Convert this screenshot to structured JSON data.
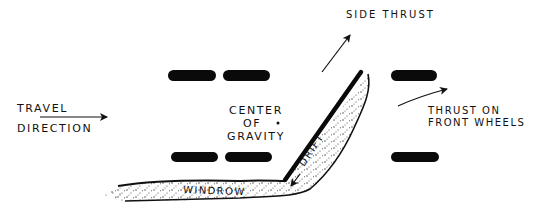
{
  "diagram": {
    "labels": {
      "travel_line1": "TRAVEL",
      "travel_line2": "DIRECTION",
      "cg_line1": "CENTER",
      "cg_line2": "OF",
      "cg_line3": "GRAVITY",
      "side_thrust": "SIDE THRUST",
      "front_thrust_line1": "THRUST ON",
      "front_thrust_line2": "FRONT WHEELS",
      "drift": "DRIFT",
      "windrow": "WINDROW"
    },
    "colors": {
      "ink": "#0a0a0a",
      "background": "#ffffff"
    }
  }
}
